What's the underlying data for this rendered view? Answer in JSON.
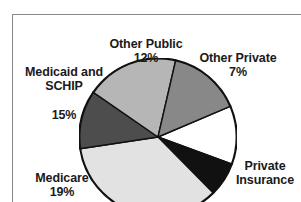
{
  "chart_data": {
    "type": "pie",
    "title": "",
    "subtitle": "",
    "xlabel": "",
    "ylabel": "",
    "legend_position": "none",
    "grid": false,
    "units": "percent",
    "total": 100,
    "center": {
      "x": 158,
      "y": 137
    },
    "radius": 79,
    "start_angle_deg": -23,
    "direction": "clockwise",
    "slices": [
      {
        "label": "Other Public",
        "value": 12,
        "value_text": "12%",
        "color": "#ffffff",
        "label_visible": true,
        "label_position": "top"
      },
      {
        "label": "Other Private",
        "value": 7,
        "value_text": "7%",
        "color": "#111111",
        "label_visible": true,
        "label_position": "top-right"
      },
      {
        "label": "Private Insurance",
        "value": 35,
        "value_text": "35%",
        "color": "#e2e2e2",
        "label_visible": true,
        "label_position": "right"
      },
      {
        "label": "",
        "value": 12,
        "value_text": "",
        "color": "#4d4d4d",
        "label_visible": false,
        "label_position": "bottom-cropped"
      },
      {
        "label": "Medicare",
        "value": 19,
        "value_text": "19%",
        "color": "#b6b6b6",
        "label_visible": true,
        "label_position": "left"
      },
      {
        "label": "Medicaid and SCHIP",
        "value": 15,
        "value_text": "15%",
        "color": "#888888",
        "label_visible": true,
        "label_position": "top-left"
      }
    ],
    "stroke_color": "#111111",
    "stroke_width": 1.4
  },
  "labels": {
    "other_public": {
      "name": "Other Public",
      "pct": "12%"
    },
    "other_private": {
      "name": "Other Private",
      "pct": "7%"
    },
    "medicaid_schip_line1": "Medicaid and",
    "medicaid_schip_line2": "SCHIP",
    "medicaid_schip_pct": "15%",
    "medicare": {
      "name": "Medicare",
      "pct": "19%"
    },
    "private_insurance_line1": "Private",
    "private_insurance_line2": "Insurance",
    "private_insurance_pct": "35%"
  },
  "colors": {
    "text": "#1a1a1a",
    "frame": "#8a8a8a",
    "background": "#ffffff",
    "outline": "#111111"
  }
}
